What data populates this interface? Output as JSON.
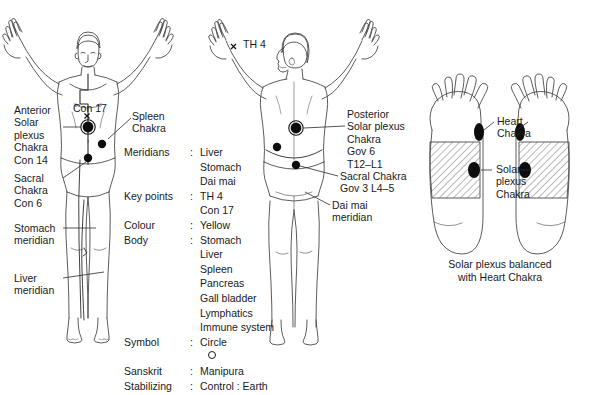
{
  "figures": {
    "anterior": {
      "name": "anterior-body-figure",
      "markers": [
        {
          "name": "con-17-cross",
          "glyph": "×"
        },
        {
          "name": "anterior-solar-plexus-chakra-dot"
        },
        {
          "name": "spleen-chakra-dot"
        },
        {
          "name": "sacral-chakra-dot"
        }
      ]
    },
    "posterior": {
      "name": "posterior-body-figure",
      "markers": [
        {
          "name": "th-4-cross",
          "glyph": "×"
        },
        {
          "name": "posterior-solar-plexus-chakra-dot"
        },
        {
          "name": "spleen-point-dot"
        },
        {
          "name": "sacral-chakra-dot"
        }
      ]
    },
    "feet": {
      "name": "feet-reflexology-figure"
    }
  },
  "anterior_labels": {
    "con17": "Con 17",
    "anterior_solar_plexus": "Anterior\nSolar\nplexus\nChakra\nCon 14",
    "spleen_chakra": "Spleen\nChakra",
    "sacral_chakra": "Sacral\nChakra\nCon 6",
    "stomach_meridian": "Stomach\nmeridian",
    "liver_meridian": "Liver\nmeridian"
  },
  "posterior_labels": {
    "th4": "TH 4",
    "posterior_solar_plexus": "Posterior\nSolar plexus\nChakra\nGov 6\nT12–L1",
    "sacral_chakra": "Sacral Chakra\nGov 3 L4–5",
    "dai_mai_meridian": "Dai mai\nmeridian"
  },
  "spec_list": [
    {
      "key": "Meridians",
      "sep": ":",
      "values": [
        "Liver",
        "Stomach",
        "Dai mai"
      ]
    },
    {
      "key": "Key points",
      "sep": ":",
      "values": [
        "TH 4",
        "Con 17"
      ]
    },
    {
      "key": "Colour",
      "sep": ":",
      "values": [
        "Yellow"
      ]
    },
    {
      "key": "Body",
      "sep": ":",
      "values": [
        "Stomach",
        "Liver",
        "Spleen",
        "Pancreas",
        "Gall bladder",
        "Lymphatics",
        "Immune system"
      ]
    },
    {
      "key": "Symbol",
      "sep": ":",
      "values": [
        "Circle"
      ],
      "symbol_glyph": "circle"
    },
    {
      "key": "Sanskrit",
      "sep": ":",
      "values": [
        "Manipura"
      ]
    },
    {
      "key": "Stabilizing",
      "sep": ":",
      "values": [
        "Control : Earth"
      ]
    }
  ],
  "feet_labels": {
    "heart_chakra": "Heart\nChakra",
    "solar_plexus_chakra": "Solar\nplexus\nChakra",
    "caption": "Solar plexus balanced\nwith Heart Chakra"
  },
  "colors": {
    "ink": "#1a1a1a",
    "outline": "#3a3a3a",
    "marker_fill": "#0d0d0d",
    "hatch": "#555555",
    "background": "#ffffff"
  }
}
